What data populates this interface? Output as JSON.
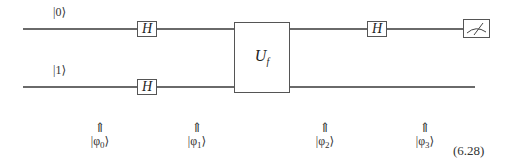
{
  "circuit": {
    "qubits": [
      {
        "label": "|0⟩"
      },
      {
        "label": "|1⟩"
      }
    ],
    "gates": [
      {
        "name": "H",
        "wire": 0,
        "position": 1
      },
      {
        "name": "H",
        "wire": 1,
        "position": 1
      },
      {
        "name": "U",
        "subscript": "f",
        "wires": [
          0,
          1
        ],
        "position": 2
      },
      {
        "name": "H",
        "wire": 0,
        "position": 3
      },
      {
        "name": "measurement",
        "wire": 0,
        "position": 4
      }
    ],
    "gate_labels": {
      "h1_top": "H",
      "h1_bottom": "H",
      "uf_main": "U",
      "uf_sub": "f",
      "h2_top": "H"
    },
    "state_markers": [
      {
        "arrow": "⇑",
        "ket_prefix": "|φ",
        "index": "0",
        "ket_suffix": "⟩"
      },
      {
        "arrow": "⇑",
        "ket_prefix": "|φ",
        "index": "1",
        "ket_suffix": "⟩"
      },
      {
        "arrow": "⇑",
        "ket_prefix": "|φ",
        "index": "2",
        "ket_suffix": "⟩"
      },
      {
        "arrow": "⇑",
        "ket_prefix": "|φ",
        "index": "3",
        "ket_suffix": "⟩"
      }
    ],
    "equation_number": "(6.28)"
  }
}
